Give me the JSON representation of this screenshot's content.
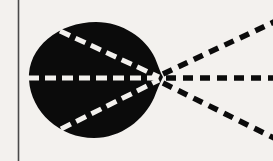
{
  "figure": {
    "canvas": {
      "width": 273,
      "height": 161,
      "background_color": "#f3f1ee"
    },
    "colors": {
      "background": "#f3f1ee",
      "blob_fill": "#0b0b0b",
      "dash_outside": "#0b0b0b",
      "dash_inside": "#f3f1ee",
      "rule": "#4a4a4a"
    },
    "border_rule": {
      "name": "left-vertical-rule",
      "x": 18,
      "y_start": 0,
      "y_end": 161,
      "thickness": 1.6,
      "color": "#4a4a4a"
    },
    "apex": {
      "label": "convergence-point",
      "x": 160,
      "y": 78
    },
    "blob": {
      "label": "filled-lobe",
      "fill": "#0b0b0b",
      "left_edge_x": 29,
      "right_apex_x": 164,
      "top_y": 22,
      "bottom_y": 138,
      "center_x": 92,
      "center_y": 79,
      "radius_x": 63,
      "radius_y": 58
    },
    "dash_style": {
      "outside_dash_length": 10,
      "outside_gap_length": 7,
      "outside_stroke_width": 5.5,
      "inside_dash_length": 11,
      "inside_gap_length": 6,
      "inside_stroke_width": 5
    },
    "rays": [
      {
        "name": "upper-ray",
        "inside_from_x": 60,
        "inside_from_y": 32,
        "outside_to_x": 273,
        "outside_to_y": 22,
        "direction": "up-right"
      },
      {
        "name": "middle-ray",
        "inside_from_x": 30,
        "inside_from_y": 78,
        "outside_to_x": 273,
        "outside_to_y": 78,
        "direction": "horizontal"
      },
      {
        "name": "lower-ray",
        "inside_from_x": 62,
        "inside_from_y": 128,
        "outside_to_x": 273,
        "outside_to_y": 137,
        "direction": "down-right"
      }
    ]
  }
}
